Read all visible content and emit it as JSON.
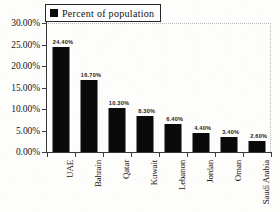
{
  "legend": {
    "label": "Percent of population",
    "swatch_icon": "square-marker-icon",
    "swatch_color": "#0a0a0a",
    "position": "top-left-inside"
  },
  "axes": {
    "y_ticks": [
      "0.00%",
      "5.00%",
      "10.00%",
      "15.00%",
      "20.00%",
      "25.00%",
      "30.00%"
    ],
    "x_categories": [
      "UAE",
      "Bahrain",
      "Qatar",
      "Kuwait",
      "Lebanon",
      "Jordan",
      "Oman",
      "Saudi Arabia"
    ],
    "xlabel": "",
    "ylabel": ""
  },
  "bar_labels": [
    "24.40%",
    "16.70%",
    "10.30%",
    "8.30%",
    "6.40%",
    "4.40%",
    "3.40%",
    "2.60%"
  ],
  "chart_data": {
    "type": "bar",
    "title": "",
    "xlabel": "",
    "ylabel": "",
    "categories": [
      "UAE",
      "Bahrain",
      "Qatar",
      "Kuwait",
      "Lebanon",
      "Jordan",
      "Oman",
      "Saudi Arabia"
    ],
    "values": [
      24.4,
      16.7,
      10.3,
      8.3,
      6.4,
      4.4,
      3.4,
      2.6
    ],
    "value_labels": [
      "24.40%",
      "16.70%",
      "10.30%",
      "8.30%",
      "6.40%",
      "4.40%",
      "3.40%",
      "2.60%"
    ],
    "series": [
      {
        "name": "Percent of population",
        "values": [
          24.4,
          16.7,
          10.3,
          8.3,
          6.4,
          4.4,
          3.4,
          2.6
        ],
        "color": "#0a0a0a"
      }
    ],
    "ylim": [
      0,
      30
    ],
    "y_tick_values": [
      0,
      5,
      10,
      15,
      20,
      25,
      30
    ],
    "y_tick_labels": [
      "0.00%",
      "5.00%",
      "10.00%",
      "15.00%",
      "20.00%",
      "25.00%",
      "30.00%"
    ],
    "y_unit": "%",
    "grid": false,
    "legend": "Percent of population",
    "legend_position": "upper left",
    "x_tick_label_rotation": 90
  }
}
